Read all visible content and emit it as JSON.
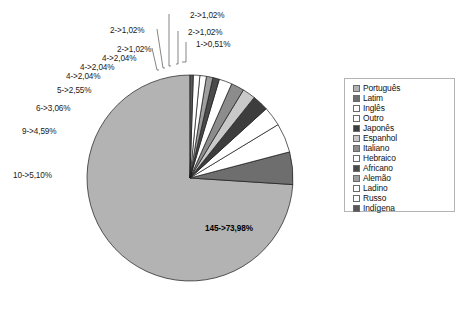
{
  "chart_data": {
    "type": "pie",
    "title": "",
    "subtitle": "",
    "xlabel": "",
    "ylabel": "",
    "legend_position": "right",
    "grid": false,
    "total_count": 196,
    "categories": [
      "Português",
      "Latim",
      "Inglês",
      "Outro",
      "Japonês",
      "Espanhol",
      "Italiano",
      "Hebraico",
      "Africano",
      "Alemão",
      "Ladino",
      "Russo",
      "Indígena"
    ],
    "values": [
      73.98,
      5.1,
      4.59,
      3.06,
      2.55,
      2.04,
      2.04,
      2.04,
      1.02,
      1.02,
      1.02,
      1.02,
      0.51
    ],
    "counts": [
      145,
      10,
      9,
      6,
      5,
      4,
      4,
      4,
      2,
      2,
      2,
      2,
      1
    ],
    "slice_labels": [
      "145->73,98%",
      "10->5,10%",
      "9->4,59%",
      "6->3,06%",
      "5->2,55%",
      "4->2,04%",
      "4->2,04%",
      "4->2,04%",
      "2->1,02%",
      "2->1,02%",
      "2->1,02%",
      "2->1,02%",
      "1->0,51%"
    ],
    "colors": [
      "#b3b3b3",
      "#6e6e6e",
      "#ffffff",
      "#ffffff",
      "#3d3d3d",
      "#c9c9c9",
      "#8c8c8c",
      "#ffffff",
      "#4a4a4a",
      "#9e9e9e",
      "#ffffff",
      "#ffffff",
      "#585858"
    ],
    "slices": [
      {
        "name": "Português",
        "label": "145->73,98%",
        "count": 145,
        "percent": 73.98,
        "color": "#b3b3b3"
      },
      {
        "name": "Latim",
        "label": "10->5,10%",
        "count": 10,
        "percent": 5.1,
        "color": "#6e6e6e"
      },
      {
        "name": "Inglês",
        "label": "9->4,59%",
        "count": 9,
        "percent": 4.59,
        "color": "#ffffff"
      },
      {
        "name": "Outro",
        "label": "6->3,06%",
        "count": 6,
        "percent": 3.06,
        "color": "#ffffff"
      },
      {
        "name": "Japonês",
        "label": "5->2,55%",
        "count": 5,
        "percent": 2.55,
        "color": "#3d3d3d"
      },
      {
        "name": "Espanhol",
        "label": "4->2,04%",
        "count": 4,
        "percent": 2.04,
        "color": "#c9c9c9"
      },
      {
        "name": "Italiano",
        "label": "4->2,04%",
        "count": 4,
        "percent": 2.04,
        "color": "#8c8c8c"
      },
      {
        "name": "Hebraico",
        "label": "4->2,04%",
        "count": 4,
        "percent": 2.04,
        "color": "#ffffff"
      },
      {
        "name": "Africano",
        "label": "2->1,02%",
        "count": 2,
        "percent": 1.02,
        "color": "#4a4a4a"
      },
      {
        "name": "Alemão",
        "label": "2->1,02%",
        "count": 2,
        "percent": 1.02,
        "color": "#9e9e9e"
      },
      {
        "name": "Ladino",
        "label": "2->1,02%",
        "count": 2,
        "percent": 1.02,
        "color": "#ffffff"
      },
      {
        "name": "Russo",
        "label": "2->1,02%",
        "count": 2,
        "percent": 1.02,
        "color": "#ffffff"
      },
      {
        "name": "Indígena",
        "label": "1->0,51%",
        "count": 1,
        "percent": 0.51,
        "color": "#585858"
      }
    ]
  },
  "callouts": [
    {
      "id": "callout-indigena",
      "text": "1->0,51%",
      "x": 196,
      "y": 40
    },
    {
      "id": "callout-russo",
      "text": "2->1,02%",
      "x": 188,
      "y": 28
    },
    {
      "id": "callout-ladino",
      "text": "2->1,02%",
      "x": 190,
      "y": 11
    },
    {
      "id": "callout-alemao",
      "text": "2->1,02%",
      "x": 110,
      "y": 26
    },
    {
      "id": "callout-africano",
      "text": "2->1,02%",
      "x": 117,
      "y": 45
    },
    {
      "id": "callout-hebraico",
      "text": "4->2,04%",
      "x": 102,
      "y": 54
    },
    {
      "id": "callout-italiano",
      "text": "4->2,04%",
      "x": 80,
      "y": 63
    },
    {
      "id": "callout-espanhol",
      "text": "4->2,04%",
      "x": 66,
      "y": 72
    },
    {
      "id": "callout-japones",
      "text": "5->2,55%",
      "x": 57,
      "y": 86
    },
    {
      "id": "callout-outro",
      "text": "6->3,06%",
      "x": 36,
      "y": 104
    },
    {
      "id": "callout-ingles",
      "text": "9->4,59%",
      "x": 22,
      "y": 127
    },
    {
      "id": "callout-latim",
      "text": "10->5,10%",
      "x": 13,
      "y": 171
    }
  ],
  "inner_label": {
    "text": "145->73,98%",
    "x": 205,
    "y": 224
  },
  "legend": {
    "items": [
      {
        "label": "Português",
        "color": "#b3b3b3"
      },
      {
        "label": "Latim",
        "color": "#6e6e6e"
      },
      {
        "label": "Inglês",
        "color": "#ffffff"
      },
      {
        "label": "Outro",
        "color": "#ffffff"
      },
      {
        "label": "Japonês",
        "color": "#3d3d3d"
      },
      {
        "label": "Espanhol",
        "color": "#c9c9c9"
      },
      {
        "label": "Italiano",
        "color": "#8c8c8c"
      },
      {
        "label": "Hebraico",
        "color": "#ffffff"
      },
      {
        "label": "Africano",
        "color": "#4a4a4a"
      },
      {
        "label": "Alemão",
        "color": "#9e9e9e"
      },
      {
        "label": "Ladino",
        "color": "#ffffff"
      },
      {
        "label": "Russo",
        "color": "#ffffff"
      },
      {
        "label": "Indígena",
        "color": "#585858"
      }
    ]
  },
  "geometry": {
    "cx": 190,
    "cy": 178,
    "r": 103,
    "start_angle_deg": 90,
    "direction": "counterclockwise"
  },
  "leader_lines": [
    {
      "id": "leader-indigena",
      "x1": 186,
      "y1": 42,
      "x2": 186,
      "y2": 62,
      "x3": 182,
      "y3": 62
    },
    {
      "id": "leader-russo",
      "x1": 178,
      "y1": 31,
      "x2": 178,
      "y2": 64,
      "x3": 176,
      "y3": 64
    },
    {
      "id": "leader-ladino",
      "x1": 169,
      "y1": 14,
      "x2": 169,
      "y2": 66,
      "x3": 171,
      "y3": 66
    },
    {
      "id": "leader-alemao",
      "x1": 157,
      "y1": 29,
      "x2": 163,
      "y2": 68,
      "x3": 165,
      "y3": 68
    },
    {
      "id": "leader-africano",
      "x1": 152,
      "y1": 48,
      "x2": 157,
      "y2": 70,
      "x3": 159,
      "y3": 70
    }
  ]
}
